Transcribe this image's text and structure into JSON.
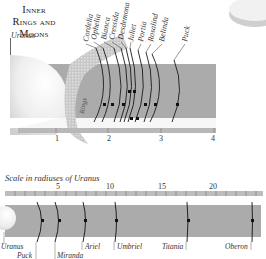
{
  "title": {
    "line1": "Inner",
    "line2": "Rings and",
    "line3": "Moons"
  },
  "uranus_label": "Uranus",
  "rings_label": "Rings",
  "inner_moons": [
    "Cordelia",
    "Ophelia",
    "Bianca",
    "Cressida",
    "Desdemona",
    "Juliet",
    "Portia",
    "Rosalind",
    "Belinda",
    "Puck"
  ],
  "inner_scale": {
    "ticks": [
      "1",
      "2",
      "3",
      "4"
    ]
  },
  "scale_caption": "Scale in radiuses of Uranus",
  "outer_scale": {
    "ticks": [
      "5",
      "10",
      "15",
      "20"
    ]
  },
  "outer_moons": [
    {
      "name": "Uranus"
    },
    {
      "name": "Puck"
    },
    {
      "name": "Miranda"
    },
    {
      "name": "Ariel"
    },
    {
      "name": "Umbriel"
    },
    {
      "name": "Titania"
    },
    {
      "name": "Oberon"
    }
  ],
  "colors": {
    "band": "#a9a9a9",
    "ruler": "#b8b8b8",
    "planet": "#ededed",
    "lines": "#1a1a1a"
  }
}
